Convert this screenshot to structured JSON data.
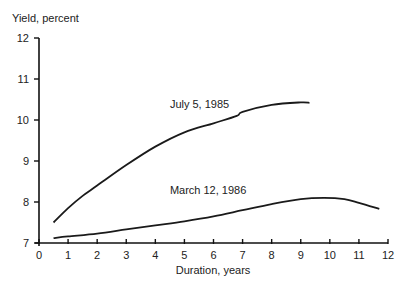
{
  "chart_data": {
    "type": "line",
    "title": "",
    "ylabel": "Yield, percent",
    "xlabel": "Duration, years",
    "xlim": [
      0,
      12
    ],
    "ylim": [
      7,
      12
    ],
    "x_ticks": [
      0,
      1,
      2,
      3,
      4,
      5,
      6,
      7,
      8,
      9,
      10,
      11,
      12
    ],
    "y_ticks": [
      7,
      8,
      9,
      10,
      11,
      12
    ],
    "grid": false,
    "legend": "none (inline curve labels)",
    "series": [
      {
        "name": "July 5, 1985",
        "label_pos": [
          4.5,
          10.3
        ],
        "points": [
          [
            0.5,
            7.5
          ],
          [
            1,
            7.85
          ],
          [
            1.5,
            8.15
          ],
          [
            2,
            8.4
          ],
          [
            3,
            8.9
          ],
          [
            4,
            9.35
          ],
          [
            5,
            9.7
          ],
          [
            6,
            9.92
          ],
          [
            6.8,
            10.1
          ],
          [
            7,
            10.2
          ],
          [
            8,
            10.37
          ],
          [
            9,
            10.43
          ],
          [
            9.3,
            10.42
          ]
        ]
      },
      {
        "name": "March 12, 1986",
        "label_pos": [
          4.5,
          8.2
        ],
        "points": [
          [
            0.5,
            7.12
          ],
          [
            1,
            7.16
          ],
          [
            2,
            7.23
          ],
          [
            3,
            7.33
          ],
          [
            4,
            7.43
          ],
          [
            5,
            7.53
          ],
          [
            6,
            7.65
          ],
          [
            7,
            7.8
          ],
          [
            8,
            7.95
          ],
          [
            9,
            8.07
          ],
          [
            9.8,
            8.1
          ],
          [
            10.5,
            8.07
          ],
          [
            11,
            7.98
          ],
          [
            11.7,
            7.83
          ]
        ]
      }
    ]
  }
}
